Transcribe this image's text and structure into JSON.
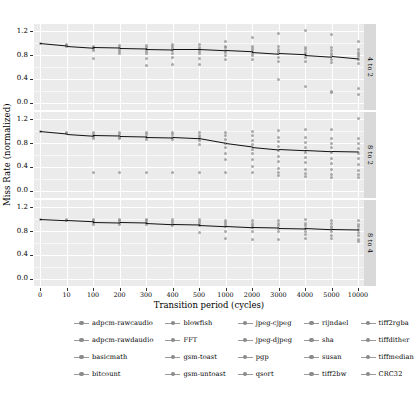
{
  "chart_data": {
    "type": "line",
    "title": "",
    "xlabel": "Transition period (cycles)",
    "ylabel": "Miss Rate (normalized)",
    "grid": true,
    "legend_position": "bottom",
    "categories": [
      "0",
      "10",
      "100",
      "200",
      "300",
      "400",
      "500",
      "1000",
      "2000",
      "3000",
      "4000",
      "5000",
      "10000"
    ],
    "ylim": [
      -0.12,
      1.32
    ],
    "yticks": [
      "0.0",
      "0.4",
      "0.8",
      "1.2"
    ],
    "ytick_values": [
      0.0,
      0.4,
      0.8,
      1.2
    ],
    "panels": [
      {
        "label": "4 to 2",
        "series": [
          {
            "name": "mean trend",
            "values": [
              1.0,
              0.96,
              0.93,
              0.92,
              0.91,
              0.9,
              0.9,
              0.88,
              0.86,
              0.83,
              0.81,
              0.78,
              0.74
            ]
          }
        ],
        "scatter": {
          "x": [
            "0",
            "10",
            "100",
            "200",
            "300",
            "400",
            "500",
            "1000",
            "2000",
            "3000",
            "4000",
            "5000",
            "10000"
          ],
          "points": [
            [
              1.0
            ],
            [
              0.96,
              0.97,
              0.95
            ],
            [
              0.95,
              0.93,
              0.91,
              0.88,
              0.74
            ],
            [
              0.96,
              0.93,
              0.9,
              0.86,
              0.82
            ],
            [
              0.96,
              0.93,
              0.9,
              0.86,
              0.82,
              0.75,
              0.63
            ],
            [
              0.97,
              0.94,
              0.91,
              0.87,
              0.82,
              0.76,
              0.64
            ],
            [
              0.97,
              0.93,
              0.9,
              0.86,
              0.82,
              0.75,
              0.64
            ],
            [
              1.02,
              0.95,
              0.92,
              0.88,
              0.84,
              0.8,
              0.73
            ],
            [
              1.1,
              0.95,
              0.91,
              0.87,
              0.83,
              0.79,
              0.72
            ],
            [
              1.16,
              0.94,
              0.9,
              0.86,
              0.82,
              0.76,
              0.7,
              0.39
            ],
            [
              1.21,
              0.93,
              0.89,
              0.85,
              0.81,
              0.76,
              0.69,
              0.27
            ],
            [
              1.14,
              0.92,
              0.87,
              0.83,
              0.79,
              0.73,
              0.67,
              0.19,
              0.17
            ],
            [
              1.03,
              0.9,
              0.85,
              0.81,
              0.77,
              0.72,
              0.66,
              0.24,
              0.14
            ]
          ]
        }
      },
      {
        "label": "8 to 2",
        "series": [
          {
            "name": "mean trend",
            "values": [
              1.0,
              0.96,
              0.93,
              0.92,
              0.91,
              0.9,
              0.88,
              0.8,
              0.74,
              0.7,
              0.68,
              0.66,
              0.65
            ]
          }
        ],
        "scatter": {
          "x": [
            "0",
            "10",
            "100",
            "200",
            "300",
            "400",
            "500",
            "1000",
            "2000",
            "3000",
            "4000",
            "5000",
            "10000"
          ],
          "points": [
            [
              1.0
            ],
            [
              0.98,
              0.96
            ],
            [
              0.97,
              0.94,
              0.91,
              0.88,
              0.31
            ],
            [
              0.97,
              0.94,
              0.9,
              0.87,
              0.31
            ],
            [
              0.97,
              0.94,
              0.9,
              0.86,
              0.31
            ],
            [
              0.97,
              0.94,
              0.9,
              0.86,
              0.31
            ],
            [
              0.97,
              0.93,
              0.89,
              0.85,
              0.78,
              0.31
            ],
            [
              0.98,
              0.92,
              0.86,
              0.8,
              0.72,
              0.62,
              0.53,
              0.31
            ],
            [
              1.0,
              0.92,
              0.85,
              0.78,
              0.7,
              0.62,
              0.52,
              0.41,
              0.31
            ],
            [
              1.01,
              0.9,
              0.82,
              0.75,
              0.67,
              0.58,
              0.49,
              0.37,
              0.3,
              0.25
            ],
            [
              1.02,
              0.89,
              0.81,
              0.73,
              0.65,
              0.56,
              0.47,
              0.36,
              0.29,
              0.24
            ],
            [
              1.02,
              0.88,
              0.8,
              0.72,
              0.64,
              0.55,
              0.46,
              0.35,
              0.28,
              0.23
            ],
            [
              1.22,
              0.87,
              0.79,
              0.71,
              0.63,
              0.54,
              0.45,
              0.34,
              0.27,
              0.22
            ]
          ]
        }
      },
      {
        "label": "8 to 4",
        "series": [
          {
            "name": "mean trend",
            "values": [
              1.0,
              0.98,
              0.96,
              0.95,
              0.94,
              0.92,
              0.91,
              0.89,
              0.87,
              0.86,
              0.85,
              0.83,
              0.82
            ]
          }
        ],
        "scatter": {
          "x": [
            "0",
            "10",
            "100",
            "200",
            "300",
            "400",
            "500",
            "1000",
            "2000",
            "3000",
            "4000",
            "5000",
            "10000"
          ],
          "points": [
            [
              1.0
            ],
            [
              0.99,
              0.98
            ],
            [
              1.0,
              0.97,
              0.94,
              0.91
            ],
            [
              1.0,
              0.97,
              0.94,
              0.91
            ],
            [
              1.0,
              0.97,
              0.94,
              0.91
            ],
            [
              0.99,
              0.96,
              0.93,
              0.9
            ],
            [
              1.0,
              0.96,
              0.93,
              0.9,
              0.78
            ],
            [
              0.98,
              0.94,
              0.91,
              0.87,
              0.8,
              0.67
            ],
            [
              0.97,
              0.93,
              0.9,
              0.86,
              0.79,
              0.66
            ],
            [
              0.97,
              0.93,
              0.89,
              0.85,
              0.79,
              0.66
            ],
            [
              1.0,
              0.93,
              0.89,
              0.85,
              0.8,
              0.74,
              0.68
            ],
            [
              0.98,
              0.92,
              0.88,
              0.84,
              0.79,
              0.73,
              0.67
            ],
            [
              0.97,
              0.91,
              0.87,
              0.83,
              0.78,
              0.72,
              0.66,
              0.62
            ]
          ]
        }
      }
    ]
  },
  "legend": {
    "items": [
      {
        "label": "adpcm-rawcaudio"
      },
      {
        "label": "blowfish"
      },
      {
        "label": "jpeg-cjpeg"
      },
      {
        "label": "rijndael"
      },
      {
        "label": "tiff2rgba"
      },
      {
        "label": "adpcm-rawdaudio"
      },
      {
        "label": "FFT"
      },
      {
        "label": "jpeg-djpeg"
      },
      {
        "label": "sha"
      },
      {
        "label": "tiffdither"
      },
      {
        "label": "basicmath"
      },
      {
        "label": "gsm-toast"
      },
      {
        "label": "pgp"
      },
      {
        "label": "susan"
      },
      {
        "label": "tiffmedian"
      },
      {
        "label": "bitcount"
      },
      {
        "label": "gsm-untoast"
      },
      {
        "label": "qsort"
      },
      {
        "label": "tiff2bw"
      },
      {
        "label": "CRC32"
      }
    ]
  },
  "colors": {
    "panel_bg": "#ebebeb",
    "strip_bg": "#d9d9d9",
    "grid_major": "#ffffff",
    "point": "#8c8c8c",
    "trend_line": "#111111"
  }
}
